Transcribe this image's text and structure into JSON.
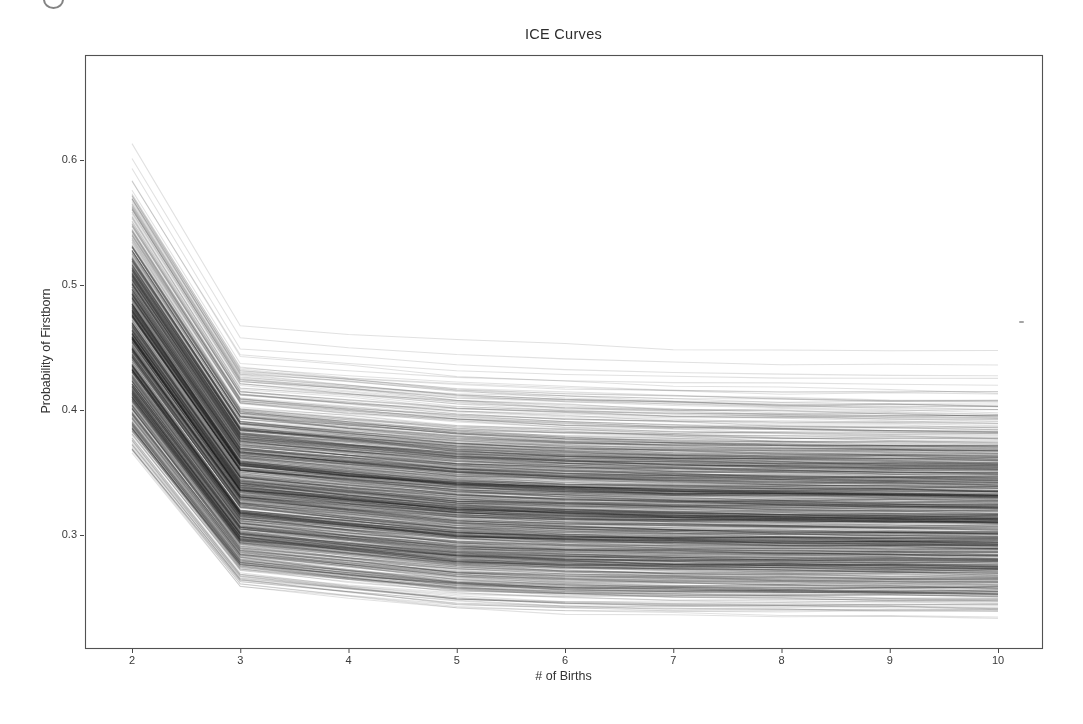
{
  "chart_data": {
    "type": "line",
    "title": "ICE Curves",
    "xlabel": "# of Births",
    "ylabel": "Probability of Firstborn",
    "x": [
      2,
      3,
      4,
      5,
      6,
      7,
      8,
      9,
      10
    ],
    "xtick_labels": [
      "2",
      "3",
      "4",
      "5",
      "6",
      "7",
      "8",
      "9",
      "10"
    ],
    "ytick_labels": [
      "0.3",
      "0.4",
      "0.5",
      "0.6"
    ],
    "ytick_values": [
      0.3,
      0.4,
      0.5,
      0.6
    ],
    "xlim": [
      1.57,
      10.41
    ],
    "ylim": [
      0.21,
      0.684
    ],
    "grid": false,
    "legend": "none",
    "n_curves": 900,
    "seed": 1337,
    "line_style": {
      "color_rgb": [
        25,
        25,
        25
      ],
      "alpha": 0.13,
      "width": 1.05
    },
    "envelope": {
      "comment": "upper and lower bounds of the curve bundle read off the plot at each x",
      "top": [
        0.648,
        0.497,
        0.491,
        0.485,
        0.481,
        0.478,
        0.476,
        0.475,
        0.474
      ],
      "bottom": [
        0.36,
        0.2545,
        0.245,
        0.2365,
        0.2335,
        0.2325,
        0.232,
        0.2315,
        0.231
      ]
    },
    "modal_curve": [
      0.455,
      0.335,
      0.327,
      0.32,
      0.317,
      0.314,
      0.313,
      0.311,
      0.31
    ],
    "generator": {
      "quantile_dist": "kumaraswamy",
      "kumaraswamy_a": 2.0,
      "kumaraswamy_b": 5.0,
      "quantile_wobble": 0.06,
      "path_jitter": 0.01
    },
    "spine_color": "#3f3f3f",
    "tick_color": "#3f3f3f"
  },
  "page": {
    "background": "#ffffff"
  }
}
